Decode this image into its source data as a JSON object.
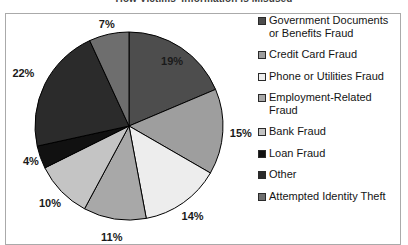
{
  "chart_data": {
    "type": "pie",
    "title": "How Victims' Information Is Misused",
    "xlabel": "",
    "ylabel": "",
    "legend_position": "right",
    "grid": false,
    "categories": [
      "Government Documents or Benefits Fraud",
      "Credit Card Fraud",
      "Phone or Utilities Fraud",
      "Employment-Related Fraud",
      "Bank Fraud",
      "Loan Fraud",
      "Other",
      "Attempted Identity Theft"
    ],
    "values": [
      19,
      15,
      14,
      11,
      10,
      4,
      22,
      7
    ],
    "value_labels": [
      "19%",
      "15%",
      "14%",
      "11%",
      "10%",
      "4%",
      "22%",
      "7%"
    ],
    "colors": [
      "#4d4d4d",
      "#9e9e9e",
      "#ededed",
      "#a8a8a8",
      "#c4c4c4",
      "#111111",
      "#2b2b2b",
      "#6e6e6e"
    ],
    "slice_outline_color": "#000000"
  },
  "legend": {
    "items": [
      {
        "label": "Government Documents\nor Benefits Fraud",
        "color": "#4d4d4d",
        "value_label": "19%"
      },
      {
        "label": "Credit Card Fraud",
        "color": "#9e9e9e",
        "value_label": "15%"
      },
      {
        "label": "Phone or Utilities Fraud",
        "color": "#ededed",
        "value_label": "14%"
      },
      {
        "label": "Employment-Related\nFraud",
        "color": "#a8a8a8",
        "value_label": "11%"
      },
      {
        "label": "Bank Fraud",
        "color": "#c4c4c4",
        "value_label": "10%"
      },
      {
        "label": "Loan Fraud",
        "color": "#111111",
        "value_label": "4%"
      },
      {
        "label": "Other",
        "color": "#2b2b2b",
        "value_label": "22%"
      },
      {
        "label": "Attempted Identity Theft",
        "color": "#6e6e6e",
        "value_label": "7%"
      }
    ]
  }
}
